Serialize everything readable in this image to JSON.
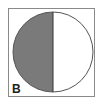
{
  "figure": {
    "label": "B",
    "shaded_fraction": 0.5,
    "shaded_side": "left",
    "colors": {
      "shade": "#7a7a7a",
      "outline": "#555555",
      "background": "#ffffff",
      "frame": "#8a8a8a"
    }
  }
}
